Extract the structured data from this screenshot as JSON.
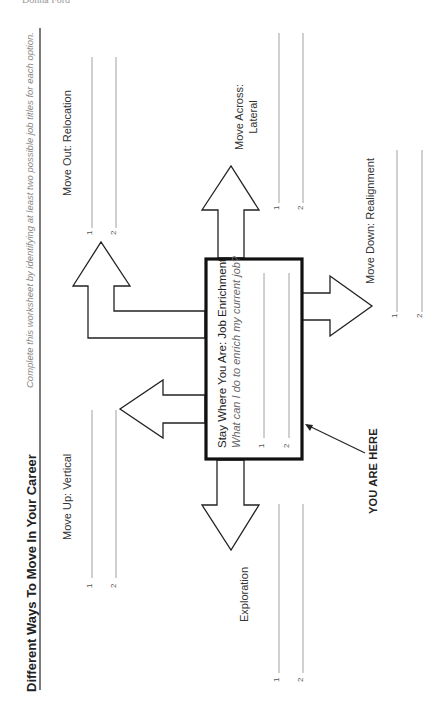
{
  "header": {
    "author": "Donna Ford"
  },
  "worksheet": {
    "title": "Different Ways To Move In Your Career",
    "instructions": "Complete this worksheet by identifying at least two possible job titles for each option.",
    "center": {
      "title": "Stay Where You Are: Job Enrichment",
      "question": "What can I do to enrich my current job?",
      "lines": [
        "1",
        "2"
      ]
    },
    "you_are_here": "YOU ARE HERE",
    "options": [
      {
        "id": "vertical",
        "label": "Move Up: Vertical",
        "lines": [
          "1",
          "2"
        ]
      },
      {
        "id": "exploration",
        "label": "Exploration",
        "lines": [
          "1",
          "2"
        ]
      },
      {
        "id": "relocation",
        "label": "Move Out: Relocation",
        "lines": [
          "1",
          "2"
        ]
      },
      {
        "id": "lateral",
        "label_line1": "Move Across:",
        "label_line2": "Lateral",
        "lines": [
          "1",
          "2"
        ]
      },
      {
        "id": "realignment",
        "label": "Move Down: Realignment",
        "lines": [
          "1",
          "2"
        ]
      }
    ]
  },
  "colors": {
    "ink": "#222222",
    "rule": "#888888",
    "subtle": "#999999"
  }
}
